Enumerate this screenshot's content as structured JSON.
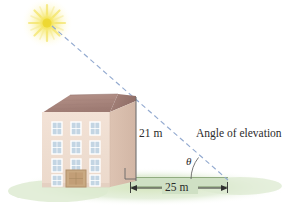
{
  "figure": {
    "background_color": "#ffffff"
  },
  "labels": {
    "height": "21 m",
    "base": "25 m",
    "angle_of_elevation": "Angle of elevation",
    "theta": "θ"
  },
  "scene": {
    "sun": {
      "name": "sun",
      "color_core": "#f7e96a",
      "color_glow": "#fdf7c0",
      "cx": 47,
      "cy": 23
    },
    "sight_line": {
      "name": "line-of-sight",
      "color": "#8fa8cf",
      "style": "dashed",
      "from_x": 52,
      "from_y": 26,
      "to_x": 228,
      "to_y": 180
    },
    "building": {
      "name": "building",
      "facade_color": "#efdcd0",
      "side_color": "#d9bfae",
      "roof_color": "#a9847b",
      "window_color": "#c6d6e2",
      "door_color": "#c2a17e",
      "window_rows": 4,
      "window_cols": 3
    },
    "ground": {
      "name": "ground",
      "grass_color": "#d9e6c6",
      "band_color": "#cfe0c4",
      "line_color": "#6e8a5c"
    },
    "vertical_leg": {
      "name": "height-leg",
      "color": "#6b6b6b",
      "x": 136,
      "y_top": 97,
      "y_bottom": 181
    },
    "horizontal_leg": {
      "name": "base-leg",
      "color": "#3a3a3a",
      "x_left": 131,
      "x_right": 227,
      "y": 188
    },
    "right_angle_marker": {
      "name": "right-angle-marker",
      "color": "#555555",
      "x": 125,
      "y": 168,
      "size": 11
    },
    "angle_arc": {
      "name": "angle-arc",
      "color": "#555555",
      "vertex_x": 227,
      "vertex_y": 180,
      "radius": 36
    }
  }
}
